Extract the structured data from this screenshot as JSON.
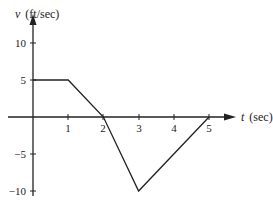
{
  "chart_data": {
    "type": "line",
    "title": "",
    "xlabel": "t (sec)",
    "ylabel": "v (ft/sec)",
    "x_ticks": [
      1,
      2,
      3,
      4,
      5
    ],
    "y_ticks": [
      10,
      5,
      -5,
      -10
    ],
    "xlim": [
      0,
      5.8
    ],
    "ylim": [
      -10.5,
      12
    ],
    "grid": false,
    "legend": null,
    "series": [
      {
        "name": "v(t)",
        "x": [
          0,
          1,
          2,
          3,
          5
        ],
        "y": [
          5,
          5,
          0,
          -10,
          0
        ]
      }
    ]
  },
  "labels": {
    "y_axis_var": "v",
    "y_axis_unit": "(ft/sec)",
    "x_axis_var": "t",
    "x_axis_unit": "(sec)",
    "xtick_1": "1",
    "xtick_2": "2",
    "xtick_3": "3",
    "xtick_4": "4",
    "xtick_5": "5",
    "ytick_10": "10",
    "ytick_5": "5",
    "ytick_m5": "−5",
    "ytick_m10": "−10"
  },
  "colors": {
    "line": "#222222",
    "axis": "#222222"
  }
}
